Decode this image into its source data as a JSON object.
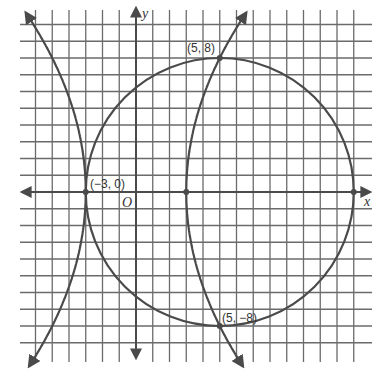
{
  "chart_data": {
    "type": "line",
    "title": "",
    "xlabel": "x",
    "ylabel": "y",
    "origin_label": "O",
    "grid": true,
    "xlim": [
      -6,
      13
    ],
    "ylim": [
      -9,
      10
    ],
    "grid_step": 1,
    "series": [
      {
        "name": "circle",
        "equation": "(x - 5)^2 + y^2 = 64",
        "center": [
          5,
          0
        ],
        "radius": 8
      },
      {
        "name": "parabola-right",
        "equation": "x = y^2/32 + 3",
        "vertex": [
          3,
          0
        ],
        "opens": "right"
      },
      {
        "name": "parabola-left",
        "equation": "x = -y^2/32 - 3",
        "vertex": [
          -3,
          0
        ],
        "opens": "left"
      }
    ],
    "points": [
      {
        "x": -3,
        "y": 0,
        "label": "(−3, 0)"
      },
      {
        "x": 5,
        "y": 8,
        "label": "(5, 8)"
      },
      {
        "x": 5,
        "y": -8,
        "label": "(5, −8)"
      },
      {
        "x": 3,
        "y": 0,
        "label": ""
      },
      {
        "x": 13,
        "y": 0,
        "label": ""
      }
    ]
  },
  "labels": {
    "x_axis": "x",
    "y_axis": "y",
    "origin": "O",
    "p_neg3_0": "(−3, 0)",
    "p_5_8": "(5, 8)",
    "p_5_neg8": "(5, −8)"
  },
  "colors": {
    "grid": "#6b6b6b",
    "axis": "#4a4a4a",
    "curve": "#4a4a4a",
    "background": "#ffffff"
  }
}
